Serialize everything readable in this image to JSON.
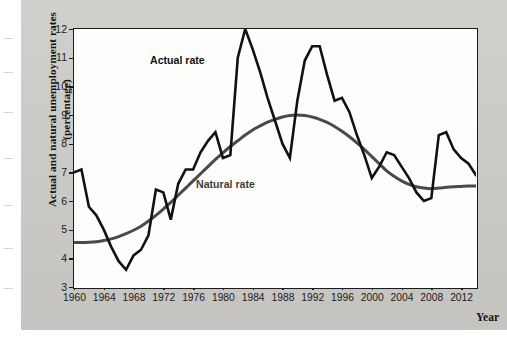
{
  "figure": {
    "background_color": "#cccac6",
    "plot_background_color": "#fdfdfb"
  },
  "chart_data": {
    "type": "line",
    "title": "",
    "subtitle": "",
    "xlabel": "Year",
    "ylabel": "Actual and natural unemployment rates (percentage)",
    "xlim": [
      1960,
      2014
    ],
    "ylim": [
      3,
      12
    ],
    "grid": false,
    "legend_position": "inline-annotations",
    "xticks": [
      "1960",
      "1964",
      "1968",
      "1972",
      "1976",
      "1980",
      "1984",
      "1988",
      "1992",
      "1996",
      "2000",
      "2004",
      "2008",
      "2012"
    ],
    "xtick_values": [
      1960,
      1964,
      1968,
      1972,
      1976,
      1980,
      1984,
      1988,
      1992,
      1996,
      2000,
      2004,
      2008,
      2012
    ],
    "yticks": [
      "3",
      "4",
      "5",
      "6",
      "7",
      "8",
      "9",
      "10",
      "11",
      "12"
    ],
    "ytick_values": [
      3,
      4,
      5,
      6,
      7,
      8,
      9,
      10,
      11,
      12
    ],
    "x": [
      1960,
      1961,
      1962,
      1963,
      1964,
      1965,
      1966,
      1967,
      1968,
      1969,
      1970,
      1971,
      1972,
      1973,
      1974,
      1975,
      1976,
      1977,
      1978,
      1979,
      1980,
      1981,
      1982,
      1983,
      1984,
      1985,
      1986,
      1987,
      1988,
      1989,
      1990,
      1991,
      1992,
      1993,
      1994,
      1995,
      1996,
      1997,
      1998,
      1999,
      2000,
      2001,
      2002,
      2003,
      2004,
      2005,
      2006,
      2007,
      2008,
      2009,
      2010,
      2011,
      2012,
      2013,
      2014
    ],
    "series": [
      {
        "name": "Actual rate",
        "color": "#111111",
        "linewidth": 2.6,
        "values": [
          7.0,
          7.1,
          5.8,
          5.5,
          5.0,
          4.4,
          3.9,
          3.6,
          4.1,
          4.3,
          4.8,
          6.4,
          6.3,
          5.35,
          6.6,
          7.1,
          7.1,
          7.7,
          8.1,
          8.4,
          7.5,
          7.6,
          11.0,
          12.0,
          11.3,
          10.5,
          9.6,
          8.8,
          8.0,
          7.5,
          9.5,
          10.9,
          11.4,
          11.4,
          10.4,
          9.5,
          9.6,
          9.1,
          8.3,
          7.6,
          6.8,
          7.2,
          7.7,
          7.6,
          7.2,
          6.8,
          6.3,
          6.0,
          6.1,
          8.3,
          8.4,
          7.8,
          7.5,
          7.3,
          6.9
        ],
        "annotation": "Actual rate"
      },
      {
        "name": "Natural rate",
        "color": "#4a4a4a",
        "linewidth": 3.0,
        "values": [
          4.55,
          4.55,
          4.56,
          4.58,
          4.62,
          4.68,
          4.76,
          4.86,
          4.98,
          5.12,
          5.3,
          5.5,
          5.72,
          5.95,
          6.2,
          6.45,
          6.7,
          6.95,
          7.2,
          7.45,
          7.68,
          7.9,
          8.1,
          8.3,
          8.48,
          8.62,
          8.75,
          8.85,
          8.93,
          8.98,
          9.0,
          8.98,
          8.93,
          8.85,
          8.74,
          8.6,
          8.43,
          8.24,
          8.03,
          7.8,
          7.55,
          7.3,
          7.05,
          6.86,
          6.7,
          6.58,
          6.5,
          6.45,
          6.43,
          6.45,
          6.48,
          6.5,
          6.51,
          6.52,
          6.52
        ],
        "annotation": "Natural rate"
      }
    ]
  },
  "annotations": {
    "actual_rate_label": "Actual rate",
    "natural_rate_label": "Natural rate"
  },
  "axis": {
    "x_title": "Year",
    "y_title_line1": "Actual and natural",
    "y_title_line2": "unemployment rates (percentage)",
    "y_title_full": "Actual and natural unemployment rates (percentage)"
  }
}
